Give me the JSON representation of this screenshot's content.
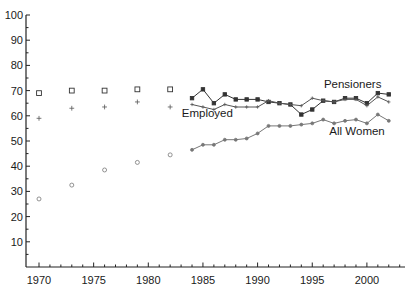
{
  "chart_data": {
    "type": "line",
    "title": "",
    "xlabel": "",
    "ylabel": "",
    "xlim": [
      1969,
      2003.5
    ],
    "ylim": [
      0,
      100
    ],
    "x_ticks": [
      1970,
      1975,
      1980,
      1985,
      1990,
      1995,
      2000
    ],
    "x_tick_labels": [
      "1970",
      "1975",
      "1980",
      "1985",
      "1990",
      "1995",
      "2000"
    ],
    "y_ticks": [
      10,
      20,
      30,
      40,
      50,
      60,
      70,
      80,
      90,
      100
    ],
    "y_tick_labels": [
      "10",
      "20",
      "30",
      "40",
      "50",
      "60",
      "70",
      "80",
      "90",
      "100"
    ],
    "grid": false,
    "legend": "inline labels",
    "series": [
      {
        "name": "Pensioners",
        "marker": "square",
        "color": "#333333",
        "scatter_x": [
          1970,
          1973,
          1976,
          1979,
          1982
        ],
        "scatter_y": [
          69,
          70,
          70,
          70.5,
          70.5
        ],
        "line_x": [
          1984,
          1985,
          1986,
          1987,
          1988,
          1989,
          1990,
          1991,
          1992,
          1993,
          1994,
          1995,
          1996,
          1997,
          1998,
          1999,
          2000,
          2001,
          2002
        ],
        "line_y": [
          67,
          70.5,
          65,
          68.5,
          66.5,
          66.5,
          66.5,
          65.5,
          65,
          64.5,
          60.5,
          62.5,
          66,
          65.5,
          67,
          67,
          65,
          69,
          68.5
        ]
      },
      {
        "name": "Employed",
        "marker": "plus",
        "color": "#555555",
        "scatter_x": [
          1970,
          1973,
          1976,
          1979,
          1982
        ],
        "scatter_y": [
          59,
          63,
          63.5,
          65.5,
          63.5
        ],
        "line_x": [
          1984,
          1985,
          1986,
          1987,
          1988,
          1989,
          1990,
          1991,
          1992,
          1993,
          1994,
          1995,
          1996,
          1997,
          1998,
          1999,
          2000,
          2001,
          2002
        ],
        "line_y": [
          64.5,
          63.5,
          62.5,
          64.5,
          63.5,
          63.5,
          63.5,
          66,
          65,
          64.5,
          64,
          67,
          66,
          65.5,
          66.5,
          66.5,
          64,
          67.5,
          65.5
        ]
      },
      {
        "name": "All Women",
        "marker": "circle",
        "color": "#777777",
        "scatter_x": [
          1970,
          1973,
          1976,
          1979,
          1982
        ],
        "scatter_y": [
          27,
          32.5,
          38.5,
          41.5,
          44.5
        ],
        "line_x": [
          1984,
          1985,
          1986,
          1987,
          1988,
          1989,
          1990,
          1991,
          1992,
          1993,
          1994,
          1995,
          1996,
          1997,
          1998,
          1999,
          2000,
          2001,
          2002
        ],
        "line_y": [
          46.5,
          48.5,
          48.5,
          50.5,
          50.5,
          51,
          53,
          56,
          56,
          56,
          56.5,
          57,
          58.5,
          57,
          58,
          58.5,
          57,
          60.5,
          58
        ]
      }
    ],
    "annotations": [
      {
        "text": "Pensioners",
        "x": 1998.7,
        "y": 71
      },
      {
        "text": "Employed",
        "x": 1985.4,
        "y": 59.5
      },
      {
        "text": "All Women",
        "x": 1999.1,
        "y": 52.5
      }
    ]
  }
}
